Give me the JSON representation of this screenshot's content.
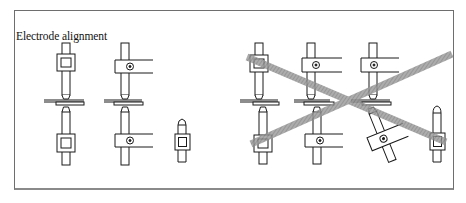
{
  "figure": {
    "title": "Electrode alignment",
    "panels": [
      {
        "id": "correct",
        "description": "Correct electrode alignment examples",
        "groups": [
          {
            "name": "square-clamp-pair",
            "clamp_type": "square",
            "pair": true,
            "aligned": true
          },
          {
            "name": "arm-clamp-pair",
            "clamp_type": "arm-with-bolt",
            "pair": true,
            "aligned": true
          },
          {
            "name": "single-electrode",
            "clamp_type": "square",
            "pair": false,
            "aligned": true
          }
        ]
      },
      {
        "id": "incorrect",
        "description": "Incorrect electrode alignment examples, crossed out",
        "crossed_out": true,
        "groups": [
          {
            "name": "square-clamp-pair",
            "clamp_type": "square",
            "pair": true,
            "aligned": false
          },
          {
            "name": "arm-clamp-pair-offset",
            "clamp_type": "arm-with-bolt",
            "pair": true,
            "aligned": false
          },
          {
            "name": "arm-clamp-pair-tilted",
            "clamp_type": "arm-with-bolt",
            "pair": true,
            "aligned": false
          },
          {
            "name": "single-electrode",
            "clamp_type": "square",
            "pair": false,
            "aligned": false
          }
        ]
      }
    ],
    "colors": {
      "line": "#1a1a1a",
      "frame": "#6e6e6e",
      "cross": "#8c8c8c",
      "background": "#ffffff"
    }
  }
}
